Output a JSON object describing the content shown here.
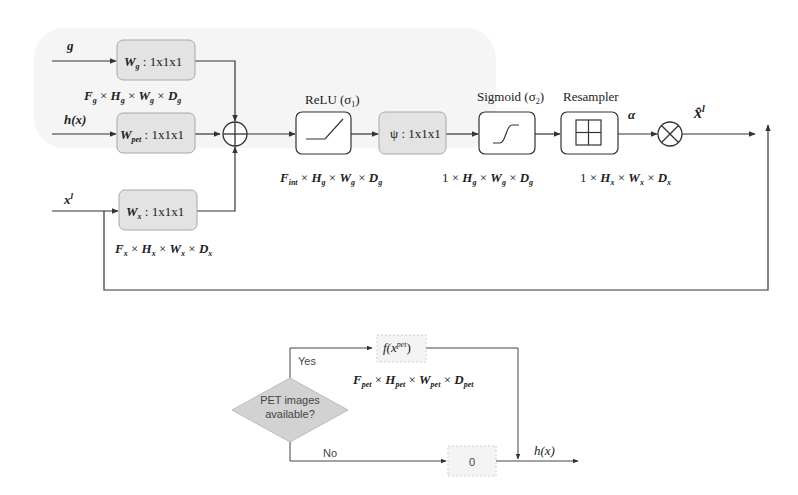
{
  "top_diagram": {
    "inputs": {
      "g": "g",
      "hx": "h(x)",
      "xl_base": "x",
      "xl_sup": "l"
    },
    "blocks": {
      "wg": {
        "w": "W",
        "sub": "g",
        "rest": " : 1x1x1"
      },
      "wpet": {
        "w": "W",
        "sub": "pet",
        "rest": " : 1x1x1"
      },
      "wx": {
        "w": "W",
        "sub": "x",
        "rest": " : 1x1x1"
      },
      "psi": "ψ : 1x1x1"
    },
    "dims": {
      "g": [
        "F",
        "g",
        " × ",
        "H",
        "g",
        " × ",
        "W",
        "g",
        " × ",
        "D",
        "g"
      ],
      "x": [
        "F",
        "x",
        " × ",
        "H",
        "x",
        " × ",
        "W",
        "x",
        " × ",
        "D",
        "x"
      ],
      "relu_out": [
        "F",
        "int",
        " × ",
        "H",
        "g",
        " × ",
        "W",
        "g",
        " × ",
        "D",
        "g"
      ],
      "sig_out": "1 × H",
      "sig_out_full": [
        "1 × ",
        "H",
        "g",
        " × ",
        "W",
        "g",
        " × ",
        "D",
        "g"
      ],
      "res_out_full": [
        "1 × ",
        "H",
        "x",
        " × ",
        "W",
        "x",
        " × ",
        "D",
        "x"
      ]
    },
    "labels": {
      "relu": "ReLU (σ",
      "relu_sub": "1",
      "sigmoid": "Sigmoid (σ",
      "sigmoid_sub": "2",
      "close_paren": ")",
      "resampler": "Resampler",
      "alpha": "α",
      "output_base": "x̂",
      "output_sup": "l"
    },
    "colors": {
      "block_fill": "#e4e4e4",
      "block_stroke": "#9a9a9a",
      "line": "#333333",
      "panel": "#f6f6f6"
    }
  },
  "bottom_flowchart": {
    "decision": [
      "PET images",
      "available?"
    ],
    "yes_label": "Yes",
    "no_label": "No",
    "f_block": "f(x",
    "f_sup": "pet",
    "f_close": ")",
    "zero_block": "0",
    "dims": [
      "F",
      "pet",
      " × ",
      "H",
      "pet",
      " × ",
      "W",
      "pet",
      " × ",
      "D",
      "pet"
    ],
    "output": "h(x)"
  }
}
